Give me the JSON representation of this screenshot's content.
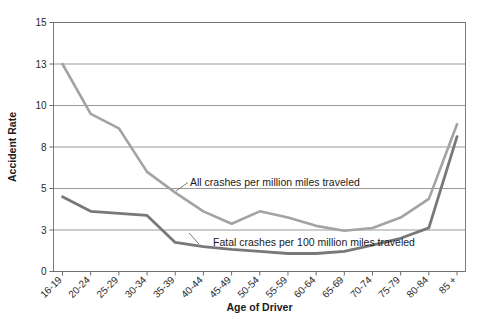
{
  "chart_data": {
    "type": "line",
    "title": "",
    "xlabel": "Age of Driver",
    "ylabel": "Accident Rate",
    "categories": [
      "16-19",
      "20-24",
      "25-29",
      "30-34",
      "35-39",
      "40-44",
      "45-49",
      "50-54",
      "55-59",
      "60-64",
      "65-69",
      "70-74",
      "75-79",
      "80-84",
      "85 +"
    ],
    "yticks": [
      0,
      3,
      5,
      8,
      10,
      13,
      15
    ],
    "ylim": [
      0,
      15
    ],
    "grid": true,
    "legend_position": "inline-annotations",
    "series": [
      {
        "name": "All crashes per million miles traveled",
        "color": "#a3a3a3",
        "values": [
          13.0,
          9.6,
          8.9,
          6.2,
          4.8,
          3.9,
          3.3,
          3.9,
          3.6,
          3.2,
          2.95,
          3.1,
          3.6,
          4.5,
          9.1
        ]
      },
      {
        "name": "Fatal crashes per 100 million miles traveled",
        "color": "#787878",
        "values": [
          4.6,
          3.9,
          3.8,
          3.7,
          2.1,
          1.8,
          1.6,
          1.45,
          1.3,
          1.3,
          1.45,
          1.9,
          2.4,
          3.1,
          8.5
        ]
      }
    ],
    "annotations": [
      {
        "text": "All crashes per million miles traveled",
        "series": 0
      },
      {
        "text": "Fatal crashes per 100 million miles traveled",
        "series": 1
      }
    ]
  },
  "axes": {
    "y_title": "Accident Rate",
    "x_title": "Age of Driver",
    "y_tick_labels": [
      "15",
      "13",
      "10",
      "8",
      "5",
      "3",
      "0"
    ],
    "x_tick_labels": [
      "16-19",
      "20-24",
      "25-29",
      "30-34",
      "35-39",
      "40-44",
      "45-49",
      "50-54",
      "55-59",
      "60-64",
      "65-69",
      "70-74",
      "75-79",
      "80-84",
      "85 +"
    ]
  },
  "annotations": {
    "all_crashes": "All crashes per million miles traveled",
    "fatal_crashes": "Fatal crashes per 100 million miles traveled"
  },
  "colors": {
    "series_all_crashes": "#a3a3a3",
    "series_fatal_crashes": "#787878",
    "gridline": "#808080",
    "frame": "#6e6e6e",
    "text": "#1a1a1a",
    "background": "#ffffff"
  }
}
